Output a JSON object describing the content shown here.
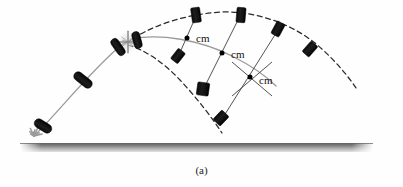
{
  "figure": {
    "caption": "(a)",
    "width": 403,
    "height": 187,
    "background_color": "#fefefe",
    "description_type": "projectile-center-of-mass-diagram"
  },
  "colors": {
    "body_dark": "#141414",
    "body_outline": "#000000",
    "trajectory_solid": "#9a9a9a",
    "trajectory_dashed": "#2a2a2a",
    "connector_line": "#4a4a4a",
    "cm_dot": "#000000",
    "ground_dark": "#7d7d7d",
    "ground_light": "#cfcfcf",
    "spark": "#9b9b9b",
    "burst_star": "#8a8a8a",
    "label_text": "#111111",
    "caption_text": "#222222"
  },
  "ground": {
    "label": "ground-surface",
    "x": 20,
    "y": 143,
    "width": 353,
    "height": 9
  },
  "launch": {
    "label": "launch-point",
    "x": 34,
    "y": 136,
    "spark_name": "launch-spark"
  },
  "burst": {
    "label": "explosion-burst",
    "x": 128,
    "y": 42,
    "radius": 13
  },
  "curves": {
    "rocket_ascent": {
      "name": "rocket-ascent-trajectory",
      "style": "solid",
      "color": "#9a9a9a",
      "path": "M 36 134 C 60 110, 90 72, 118 48 C 124 43, 128 41, 134 38"
    },
    "cm_parabola": {
      "name": "center-of-mass-trajectory",
      "style": "solid",
      "color": "#9a9a9a",
      "path": "M 131 39 C 160 33, 200 40, 232 56 C 254 67, 268 78, 276 86"
    },
    "fragment_upper": {
      "name": "upper-fragment-trajectory",
      "style": "dashed",
      "color": "#2a2a2a",
      "path": "M 126 43 C 150 26, 185 14, 222 12 C 262 11, 300 28, 323 50 C 337 63, 348 76, 356 88"
    },
    "fragment_lower": {
      "name": "lower-fragment-trajectory",
      "style": "dashed",
      "color": "#2a2a2a",
      "path": "M 128 45 C 145 50, 163 62, 180 80 C 196 97, 210 115, 222 133"
    }
  },
  "connectors": [
    {
      "name": "connector-pair-1",
      "x1": 196,
      "y1": 16,
      "x2": 178,
      "y2": 57
    },
    {
      "name": "connector-pair-2",
      "x1": 240,
      "y1": 16,
      "x2": 203,
      "y2": 90
    },
    {
      "name": "connector-pair-3",
      "x1": 278,
      "y1": 30,
      "x2": 222,
      "y2": 119
    },
    {
      "name": "connector-cm-tick-3a",
      "x1": 232,
      "y1": 62,
      "x2": 272,
      "y2": 96
    },
    {
      "name": "connector-cm-tick-3b",
      "x1": 272,
      "y1": 62,
      "x2": 232,
      "y2": 96
    }
  ],
  "cm_markers": [
    {
      "name": "cm-marker-1",
      "label": "cm",
      "dot_x": 187,
      "dot_y": 38,
      "text_x": 196,
      "text_y": 38
    },
    {
      "name": "cm-marker-2",
      "label": "cm",
      "dot_x": 222,
      "dot_y": 53,
      "text_x": 231,
      "text_y": 54
    },
    {
      "name": "cm-marker-3",
      "label": "cm",
      "dot_x": 250,
      "dot_y": 77,
      "text_x": 259,
      "text_y": 80
    }
  ],
  "bodies": [
    {
      "name": "rocket-at-launch",
      "cx": 43,
      "cy": 126,
      "angle": -58,
      "w": 9,
      "h": 19,
      "shape": "capsule"
    },
    {
      "name": "rocket-ascending-low",
      "cx": 83,
      "cy": 80,
      "angle": -52,
      "w": 9,
      "h": 21,
      "shape": "capsule"
    },
    {
      "name": "rocket-ascending-high",
      "cx": 118,
      "cy": 47,
      "angle": -35,
      "w": 8,
      "h": 19,
      "shape": "capsule"
    },
    {
      "name": "shell-at-burst",
      "cx": 137,
      "cy": 40,
      "angle": -15,
      "w": 8,
      "h": 17,
      "shape": "capsule"
    },
    {
      "name": "fragment-upper-1",
      "cx": 196,
      "cy": 15,
      "angle": -8,
      "w": 9,
      "h": 15,
      "shape": "block"
    },
    {
      "name": "fragment-upper-2",
      "cx": 241,
      "cy": 15,
      "angle": 5,
      "w": 9,
      "h": 15,
      "shape": "block"
    },
    {
      "name": "fragment-upper-3",
      "cx": 278,
      "cy": 29,
      "angle": 28,
      "w": 9,
      "h": 14,
      "shape": "block"
    },
    {
      "name": "fragment-upper-4",
      "cx": 310,
      "cy": 49,
      "angle": 42,
      "w": 9,
      "h": 14,
      "shape": "block"
    },
    {
      "name": "fragment-lower-1",
      "cx": 178,
      "cy": 56,
      "angle": 38,
      "w": 9,
      "h": 13,
      "shape": "block"
    },
    {
      "name": "fragment-lower-2",
      "cx": 203,
      "cy": 89,
      "angle": 8,
      "w": 12,
      "h": 13,
      "shape": "block"
    },
    {
      "name": "fragment-lower-3",
      "cx": 221,
      "cy": 118,
      "angle": 44,
      "w": 10,
      "h": 13,
      "shape": "block"
    }
  ]
}
